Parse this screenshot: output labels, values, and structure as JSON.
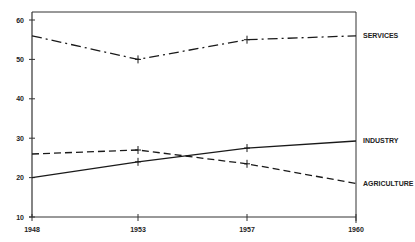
{
  "chart_data": {
    "type": "line",
    "title": "",
    "xlabel": "",
    "ylabel": "",
    "categories": [
      "1948",
      "1953",
      "1957",
      "1960"
    ],
    "ylim": [
      10,
      63
    ],
    "yticks": [
      10,
      20,
      30,
      40,
      50,
      60
    ],
    "grid": false,
    "legend_position": "right-inline",
    "series": [
      {
        "name": "SERVICES",
        "style": "dash-dot",
        "values": [
          56,
          50,
          55,
          56
        ]
      },
      {
        "name": "INDUSTRY",
        "style": "solid",
        "values": [
          20,
          24,
          27.5,
          29.3
        ]
      },
      {
        "name": "AGRICULTURE",
        "style": "dashed",
        "values": [
          26,
          27,
          23.5,
          18.5
        ]
      }
    ]
  },
  "colors": {
    "line": "#1a1a1a",
    "axis": "#333333",
    "background": "#ffffff"
  }
}
